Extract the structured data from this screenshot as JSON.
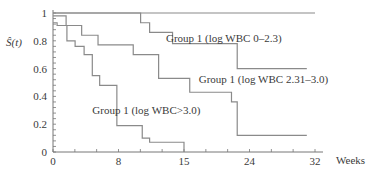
{
  "chart_data": {
    "type": "line",
    "subtype": "kaplan-meier step",
    "title": "",
    "xlabel": "Weeks",
    "ylabel": "Ŝ(t)",
    "xlim": [
      0,
      32
    ],
    "ylim": [
      0,
      1
    ],
    "x_ticks": [
      {
        "value": 0,
        "label": "0"
      },
      {
        "value": 8,
        "label": "8"
      },
      {
        "value": 16,
        "label": "15"
      },
      {
        "value": 24,
        "label": "24"
      },
      {
        "value": 32,
        "label": "32"
      }
    ],
    "x_minor_ticks": [
      0,
      2.67,
      5.33,
      8,
      10.67,
      13.33,
      16,
      18.67,
      21.33,
      24,
      26.67,
      29.33,
      32
    ],
    "y_ticks": [
      {
        "value": 0,
        "label": "0"
      },
      {
        "value": 0.2,
        "label": "0.2"
      },
      {
        "value": 0.4,
        "label": "0.4"
      },
      {
        "value": 0.6,
        "label": "0.6"
      },
      {
        "value": 0.8,
        "label": "0.8"
      },
      {
        "value": 1,
        "label": "1"
      }
    ],
    "grid": false,
    "legend": "inline labels",
    "series": [
      {
        "name": "Group 1 (log WBC 0–2.3)",
        "label_pos": [
          13.8,
          0.79
        ],
        "steps": [
          [
            0,
            1.0
          ],
          [
            10.7,
            0.93
          ],
          [
            11.8,
            0.86
          ],
          [
            14.6,
            0.78
          ],
          [
            22.5,
            0.6
          ],
          [
            31,
            0.6
          ]
        ]
      },
      {
        "name": "Group 1 (log WBC 2.31–3.0)",
        "label_pos": [
          17.8,
          0.5
        ],
        "steps": [
          [
            0,
            0.98
          ],
          [
            1.6,
            0.91
          ],
          [
            3.5,
            0.84
          ],
          [
            5.5,
            0.77
          ],
          [
            9.8,
            0.7
          ],
          [
            12.9,
            0.53
          ],
          [
            16.7,
            0.43
          ],
          [
            21.8,
            0.36
          ],
          [
            22.5,
            0.12
          ],
          [
            31,
            0.12
          ]
        ]
      },
      {
        "name": "Group 1 (log WBC>3.0)",
        "label_pos": [
          4.8,
          0.27
        ],
        "steps": [
          [
            0,
            0.93
          ],
          [
            0.5,
            0.91
          ],
          [
            1.7,
            0.8
          ],
          [
            2.7,
            0.76
          ],
          [
            3.8,
            0.7
          ],
          [
            4.8,
            0.55
          ],
          [
            5.7,
            0.48
          ],
          [
            7.8,
            0.19
          ],
          [
            10.9,
            0.1
          ],
          [
            11.8,
            0.07
          ],
          [
            16,
            0.0
          ]
        ]
      },
      {
        "name": "reference S(t)=1",
        "label_pos": null,
        "steps": [
          [
            0,
            1.0
          ],
          [
            32,
            1.0
          ]
        ]
      }
    ]
  }
}
